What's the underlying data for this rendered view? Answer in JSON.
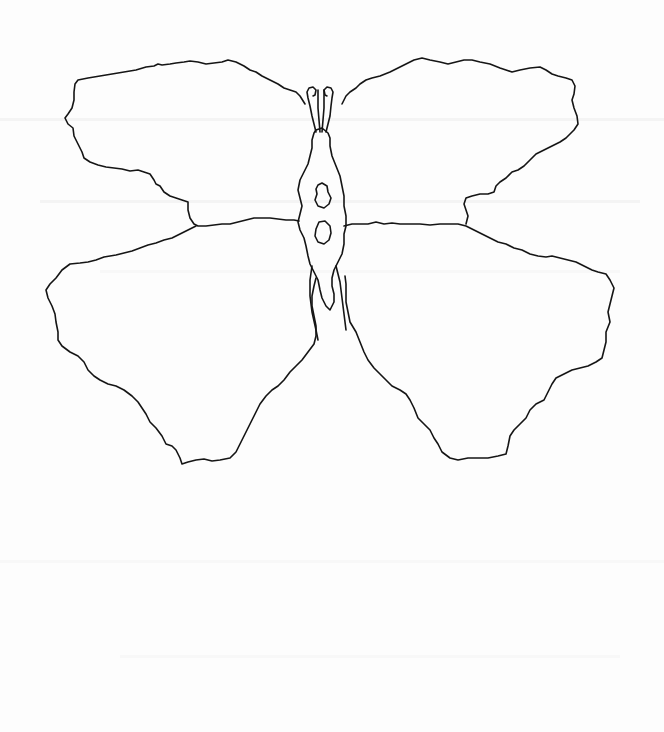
{
  "image": {
    "subject": "butterfly line drawing",
    "medium": "scanned pencil/ink outline on white paper",
    "colors": {
      "paper": "#fdfdfd",
      "ink": "#151515",
      "scan_streak": "#eeeeee"
    },
    "parts": {
      "antennae": "two curled antenna loops",
      "body": "elongated diamond-shaped thorax with two spots",
      "left_forewing": "upper left wing",
      "left_hindwing": "lower left wing",
      "right_forewing": "upper right wing",
      "right_hindwing": "lower right wing"
    }
  }
}
